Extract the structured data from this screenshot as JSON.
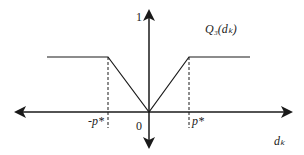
{
  "diagram": {
    "y_label": "Q₃(dₖ)",
    "x_label": "dₖ",
    "y_tick": "1",
    "origin": "0",
    "neg_threshold": "-p*",
    "pos_threshold": "p*",
    "line_color": "#1a1a1a"
  }
}
